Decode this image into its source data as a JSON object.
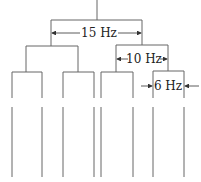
{
  "diagram": {
    "type": "splitting-tree",
    "labels": {
      "level1": "15 Hz",
      "level2": "10 Hz",
      "level3": "6 Hz"
    },
    "line_color": "#555555",
    "leaf_count": 8
  }
}
